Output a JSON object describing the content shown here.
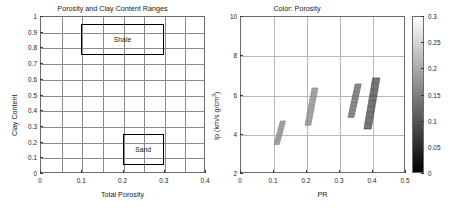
{
  "figure": {
    "width": 449,
    "height": 208,
    "background": "#ffffff"
  },
  "chart_data": [
    {
      "type": "rect-regions",
      "panel": "left",
      "title": "Porosity and Clay Content Ranges",
      "xlabel": "Total Porosity",
      "ylabel": "Clay Content",
      "xlim": [
        0,
        0.4
      ],
      "ylim": [
        0,
        1
      ],
      "xticks": [
        0,
        0.1,
        0.2,
        0.3,
        0.4
      ],
      "xticklabels": [
        "0",
        "0.1",
        "0.2",
        "0.3",
        "0.4"
      ],
      "yticks": [
        0,
        0.1,
        0.2,
        0.3,
        0.4,
        0.5,
        0.6,
        0.7,
        0.8,
        0.9,
        1
      ],
      "yticklabels": [
        "0",
        "0.1",
        "0.2",
        "0.3",
        "0.4",
        "0.5",
        "0.6",
        "0.7",
        "0.8",
        "0.9",
        "1"
      ],
      "grid": true,
      "grid_x_step": 0.05,
      "grid_y_step": 0.1,
      "regions": [
        {
          "name": "Shale",
          "label": "Shale",
          "x0": 0.1,
          "x1": 0.3,
          "y0": 0.75,
          "y1": 0.95,
          "edgecolor": "#000000"
        },
        {
          "name": "Sand",
          "label": "Sand",
          "x0": 0.2,
          "x1": 0.3,
          "y0": 0.05,
          "y1": 0.25,
          "edgecolor": "#000000"
        }
      ]
    },
    {
      "type": "scatter",
      "panel": "right",
      "title": "Color: Porosity",
      "xlabel": "PR",
      "ylabel": "Ip (km/s g/cm",
      "ylabel_sup": "3",
      "ylabel_tail": ")",
      "xlim": [
        0,
        0.5
      ],
      "ylim": [
        2,
        10
      ],
      "xticks": [
        0,
        0.1,
        0.2,
        0.3,
        0.4,
        0.5
      ],
      "xticklabels": [
        "0",
        "0.1",
        "0.2",
        "0.3",
        "0.4",
        "0.5"
      ],
      "yticks": [
        2,
        4,
        6,
        8,
        10
      ],
      "yticklabels": [
        "2",
        "4",
        "6",
        "8",
        "10"
      ],
      "grid": true,
      "clusters": [
        {
          "name": "cluster-1",
          "x_range": [
            0.1,
            0.135
          ],
          "y_range": [
            3.5,
            4.7
          ],
          "shade": "mid"
        },
        {
          "name": "cluster-2",
          "x_range": [
            0.193,
            0.232
          ],
          "y_range": [
            4.5,
            6.4
          ],
          "shade": "mid"
        },
        {
          "name": "cluster-3",
          "x_range": [
            0.325,
            0.365
          ],
          "y_range": [
            4.9,
            6.6
          ],
          "shade": "dark"
        },
        {
          "name": "cluster-4",
          "x_range": [
            0.372,
            0.42
          ],
          "y_range": [
            4.3,
            6.9
          ],
          "shade": "darker"
        }
      ],
      "colorbar": {
        "name": "porosity-colorbar",
        "label": "",
        "vmin": 0,
        "vmax": 0.3,
        "colormap": "gray",
        "low_color": "#000000",
        "high_color": "#ffffff",
        "ticks": [
          0.3,
          0.25,
          0.2,
          0.15,
          0.1,
          0.05,
          0
        ],
        "ticklabels": [
          "0.3",
          "0.25",
          "0.2",
          "0.15",
          "0.1",
          "0.05",
          "0"
        ]
      }
    }
  ]
}
